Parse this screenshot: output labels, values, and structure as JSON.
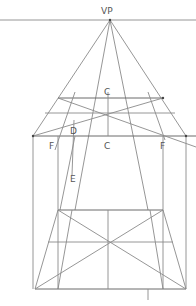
{
  "diagram": {
    "labels": {
      "vp": "VP",
      "c_top": "C",
      "c_bottom": "C",
      "d": "D",
      "e": "E",
      "f_left": "F",
      "f_right": "F"
    },
    "colors": {
      "line": "#8a8a8a",
      "label": "#555555",
      "background": "#ffffff"
    }
  }
}
